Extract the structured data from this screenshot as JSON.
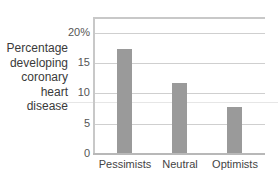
{
  "chart_data": {
    "type": "bar",
    "title": "",
    "xlabel": "",
    "ylabel": "Percentage developing coronary heart disease",
    "ylabel_lines": [
      "Percentage",
      "developing",
      "coronary",
      "heart disease"
    ],
    "categories": [
      "Pessimists",
      "Neutral",
      "Optimists"
    ],
    "values": [
      17.3,
      11.7,
      7.8
    ],
    "ylim": [
      0,
      20
    ],
    "yticks": [
      "0",
      "5",
      "10",
      "15",
      "20%"
    ],
    "grid": true,
    "legend": null,
    "bar_color": "#9a9a9a"
  }
}
